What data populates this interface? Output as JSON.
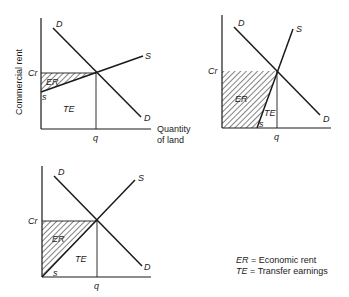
{
  "y_axis_label": "Commercial rent",
  "x_axis_label_line1": "Quantity",
  "x_axis_label_line2": "of land",
  "labels": {
    "demand": "D",
    "supply": "S",
    "price": "Cr",
    "quantity": "q",
    "supply_start": "s",
    "economic_rent": "ER",
    "transfer_earnings": "TE"
  },
  "legend": [
    {
      "abbr": "ER",
      "sep": " = ",
      "text": "Economic rent"
    },
    {
      "abbr": "TE",
      "sep": " = ",
      "text": "Transfer earnings"
    }
  ],
  "panels": [
    {
      "name": "elastic-supply",
      "description": "Shallow supply curve: mostly transfer earnings, small economic rent"
    },
    {
      "name": "inelastic-supply",
      "description": "Steep supply curve: mostly economic rent, small transfer earnings"
    },
    {
      "name": "unit-supply",
      "description": "Supply from origin: equal economic rent and transfer earnings"
    }
  ],
  "colors": {
    "ink": "#1a1a1a",
    "background": "#ffffff"
  }
}
